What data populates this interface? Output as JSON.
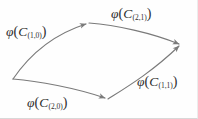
{
  "figure": {
    "stroke_color": "#7a7a7a",
    "background_color": "#fefefe",
    "text_color": "#2f2f2f"
  },
  "labels": {
    "top_left": {
      "phi": "φ",
      "open": "(",
      "cvar": "C",
      "sub": "(1,0)",
      "close": ")"
    },
    "top_right": {
      "phi": "φ",
      "open": "(",
      "cvar": "C",
      "sub": "(2,1)",
      "close": ")"
    },
    "bottom_left": {
      "phi": "φ",
      "open": "(",
      "cvar": "C",
      "sub": "(2,0)",
      "close": ")"
    },
    "bottom_right": {
      "phi": "φ",
      "open": "(",
      "cvar": "C",
      "sub": "(1,1)",
      "close": ")"
    }
  },
  "arrows": [
    {
      "name": "upper-left-arrow",
      "label_ref": "top_left",
      "from": [
        13,
        79
      ],
      "to": [
        88,
        23
      ]
    },
    {
      "name": "upper-right-arrow",
      "label_ref": "top_right",
      "from": [
        88,
        23
      ],
      "to": [
        181,
        45
      ]
    },
    {
      "name": "lower-left-arrow",
      "label_ref": "bottom_left",
      "from": [
        13,
        79
      ],
      "to": [
        108,
        99
      ]
    },
    {
      "name": "lower-right-arrow",
      "label_ref": "bottom_right",
      "from": [
        108,
        99
      ],
      "to": [
        181,
        45
      ]
    }
  ]
}
